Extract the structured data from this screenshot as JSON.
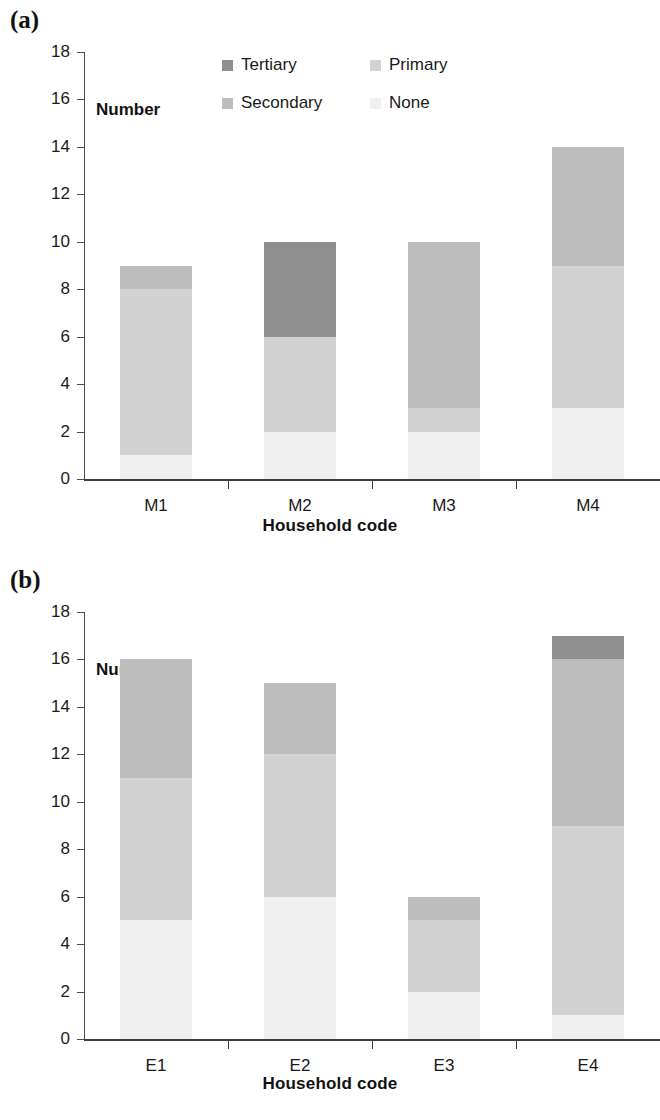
{
  "figure": {
    "panels": [
      {
        "letter": "(a)",
        "number_label": "Number",
        "xaxis_title": "Household code",
        "legend_layout": "two-column",
        "legend": [
          "Tertiary",
          "Primary",
          "Secondary",
          "None"
        ]
      },
      {
        "letter": "(b)",
        "number_label": "Number",
        "xaxis_title": "Household code",
        "legend_layout": "single-column",
        "legend": [
          "Tertiary",
          "Secondary",
          "Primary",
          "None"
        ]
      }
    ]
  },
  "colors": {
    "tertiary": "#8f8f8f",
    "secondary": "#bdbdbd",
    "primary": "#d2d2d2",
    "none": "#f0f0f0",
    "axis": "#3c3c3c",
    "text": "#1a1a1a"
  },
  "yticks": [
    "0",
    "2",
    "4",
    "6",
    "8",
    "10",
    "12",
    "14",
    "16",
    "18"
  ],
  "chart_data": [
    {
      "type": "bar",
      "stacked": true,
      "title": "(a)",
      "xlabel": "Household code",
      "ylabel": "Number",
      "ylim": [
        0,
        18
      ],
      "ytick_step": 2,
      "grid": false,
      "legend_position": "top-center",
      "categories": [
        "M1",
        "M2",
        "M3",
        "M4"
      ],
      "series": [
        {
          "name": "None",
          "values": [
            1,
            2,
            2,
            3
          ]
        },
        {
          "name": "Primary",
          "values": [
            7,
            4,
            1,
            6
          ]
        },
        {
          "name": "Secondary",
          "values": [
            1,
            0,
            7,
            5
          ]
        },
        {
          "name": "Tertiary",
          "values": [
            0,
            4,
            0,
            0
          ]
        }
      ],
      "totals": [
        9,
        10,
        10,
        14
      ]
    },
    {
      "type": "bar",
      "stacked": true,
      "title": "(b)",
      "xlabel": "Household code",
      "ylabel": "Number",
      "ylim": [
        0,
        18
      ],
      "ytick_step": 2,
      "grid": false,
      "legend_position": "top-right",
      "categories": [
        "E1",
        "E2",
        "E3",
        "E4"
      ],
      "series": [
        {
          "name": "None",
          "values": [
            5,
            6,
            2,
            1
          ]
        },
        {
          "name": "Primary",
          "values": [
            6,
            6,
            3,
            8
          ]
        },
        {
          "name": "Secondary",
          "values": [
            5,
            3,
            1,
            7
          ]
        },
        {
          "name": "Tertiary",
          "values": [
            0,
            0,
            0,
            1
          ]
        }
      ],
      "totals": [
        16,
        15,
        6,
        17
      ]
    }
  ]
}
